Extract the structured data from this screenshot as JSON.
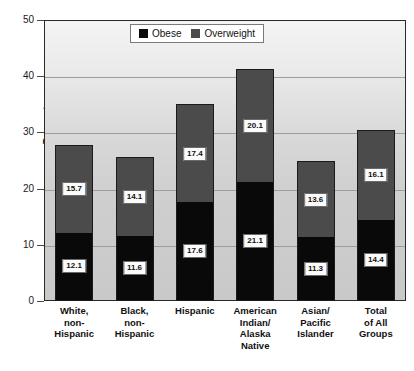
{
  "chart_data": {
    "type": "bar",
    "subtype": "stacked-vertical",
    "title": "",
    "xlabel": "",
    "ylabel": "Percent",
    "ylim": [
      0,
      50
    ],
    "yticks": [
      0,
      10,
      20,
      30,
      40,
      50
    ],
    "grid": true,
    "legend_position": "top-center",
    "categories": [
      "White,\nnon-\nHispanic",
      "Black,\nnon-\nHispanic",
      "Hispanic",
      "American\nIndian/\nAlaska\nNative",
      "Asian/\nPacific\nIslander",
      "Total\nof All\nGroups"
    ],
    "category_lines": [
      [
        "White,",
        "non-",
        "Hispanic"
      ],
      [
        "Black,",
        "non-",
        "Hispanic"
      ],
      [
        "Hispanic"
      ],
      [
        "American",
        "Indian/",
        "Alaska",
        "Native"
      ],
      [
        "Asian/",
        "Pacific",
        "Islander"
      ],
      [
        "Total",
        "of All",
        "Groups"
      ]
    ],
    "series": [
      {
        "name": "Obese",
        "color": "#090909",
        "values": [
          12.1,
          11.6,
          17.6,
          21.1,
          11.3,
          14.4
        ]
      },
      {
        "name": "Overweight",
        "color": "#4b4b4b",
        "values": [
          15.7,
          14.1,
          17.4,
          20.1,
          13.6,
          16.1
        ]
      }
    ],
    "totals": [
      27.8,
      25.7,
      35.0,
      41.2,
      24.9,
      30.5
    ]
  },
  "legend": {
    "items": [
      {
        "label": "Obese",
        "color": "#090909"
      },
      {
        "label": "Overweight",
        "color": "#4b4b4b"
      }
    ]
  },
  "axes": {
    "y_title": "Percent",
    "y_tick_labels": [
      "50",
      "40",
      "30",
      "20",
      "10",
      "0"
    ]
  },
  "colors": {
    "obese": "#090909",
    "overweight": "#4b4b4b",
    "frame": "#2a2a2a",
    "gridline": "#9d9d9d",
    "label_box_bg": "#fbfbfb",
    "text": "#111111"
  }
}
